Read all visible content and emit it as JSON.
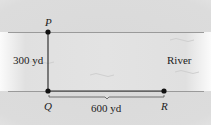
{
  "diagram": {
    "points": {
      "P": {
        "label": "P",
        "x": 48,
        "y": 32
      },
      "Q": {
        "label": "Q",
        "x": 48,
        "y": 91
      },
      "R": {
        "label": "R",
        "x": 164,
        "y": 91
      }
    },
    "labels": {
      "PQ": "300 yd",
      "QR": "600 yd",
      "river": "River"
    }
  }
}
